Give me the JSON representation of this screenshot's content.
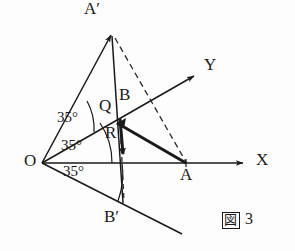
{
  "figure": {
    "caption_symbol": "図",
    "caption_number": "3",
    "stroke_color": "#1a1a1a",
    "background_color": "#fdfdfd"
  },
  "points": [
    {
      "name": "O",
      "label": "O",
      "x": 42,
      "y": 163,
      "label_x": 24,
      "label_y": 155
    },
    {
      "name": "A",
      "label": "A",
      "x": 186,
      "y": 163,
      "label_x": 180,
      "label_y": 168
    },
    {
      "name": "B",
      "label": "B",
      "x": 122,
      "y": 118,
      "label_x": 121,
      "label_y": 88
    },
    {
      "name": "Q",
      "label": "Q",
      "x": 118,
      "y": 122,
      "label_x": 101,
      "label_y": 100
    },
    {
      "name": "R",
      "label": "R",
      "x": 122,
      "y": 140,
      "label_x": 107,
      "label_y": 126
    },
    {
      "name": "A-prime",
      "label": "A′",
      "x": 112,
      "y": 32,
      "label_x": 85,
      "label_y": 2
    },
    {
      "name": "B-prime",
      "label": "B′",
      "x": 123,
      "y": 204,
      "label_x": 105,
      "label_y": 210
    }
  ],
  "axes": [
    {
      "name": "x-axis",
      "label": "X",
      "label_x": 258,
      "label_y": 152,
      "from": [
        42,
        163
      ],
      "to": [
        247,
        163
      ]
    },
    {
      "name": "y-axis",
      "label": "Y",
      "label_x": 206,
      "label_y": 56,
      "from": [
        42,
        163
      ],
      "to": [
        198,
        74
      ]
    }
  ],
  "rays": [
    {
      "name": "ray-to-a-prime",
      "from": [
        42,
        163
      ],
      "to": [
        115,
        27
      ]
    },
    {
      "name": "ray-lower",
      "from": [
        42,
        163
      ],
      "to": [
        182,
        234
      ]
    }
  ],
  "angles": [
    {
      "name": "angle-upper",
      "value": "35°",
      "label_x": 58,
      "label_y": 112
    },
    {
      "name": "angle-middle",
      "value": "35°",
      "label_x": 62,
      "label_y": 139
    },
    {
      "name": "angle-lower",
      "value": "35°",
      "label_x": 64,
      "label_y": 165
    }
  ],
  "segments": [
    {
      "name": "segment-a-prime-to-b-prime",
      "style": "solid",
      "from": [
        112,
        34
      ],
      "to": [
        124,
        203
      ]
    },
    {
      "name": "segment-q-to-a",
      "style": "thick",
      "from": [
        118,
        123
      ],
      "to": [
        186,
        163
      ]
    },
    {
      "name": "vector-q-to-r",
      "style": "thick-arrow",
      "from": [
        120,
        119
      ],
      "to": [
        124,
        160
      ]
    },
    {
      "name": "dashed-a-prime-to-a",
      "style": "dashed",
      "from": [
        114,
        36
      ],
      "to": [
        186,
        162
      ]
    },
    {
      "name": "dashed-b-to-b-prime",
      "style": "dashed",
      "from": [
        122,
        120
      ],
      "to": [
        124,
        202
      ]
    }
  ]
}
